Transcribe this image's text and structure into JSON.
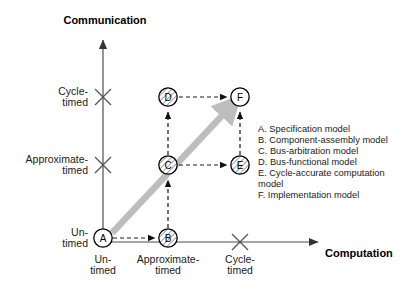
{
  "diagram": {
    "axes": {
      "y_title": "Communication",
      "x_title": "Computation",
      "y_ticks": [
        {
          "line1": "Cycle-",
          "line2": "timed"
        },
        {
          "line1": "Approximate-",
          "line2": "timed"
        },
        {
          "line1": "Un-",
          "line2": "timed"
        }
      ],
      "x_ticks": [
        {
          "line1": "Un-",
          "line2": "timed"
        },
        {
          "line1": "Approximate-",
          "line2": "timed"
        },
        {
          "line1": "Cycle-",
          "line2": "timed"
        }
      ]
    },
    "nodes": [
      {
        "id": "A",
        "label": "A"
      },
      {
        "id": "B",
        "label": "B"
      },
      {
        "id": "C",
        "label": "C"
      },
      {
        "id": "D",
        "label": "D"
      },
      {
        "id": "E",
        "label": "E"
      },
      {
        "id": "F",
        "label": "F"
      }
    ],
    "legend": [
      "A. Specification model",
      "B. Component-assembly model",
      "C. Bus-arbitration model",
      "D. Bus-functional model",
      "E. Cycle-accurate computation",
      "model",
      "F. Implementation model"
    ],
    "colors": {
      "axis": "#4d4d4d",
      "node_stroke": "#000000",
      "dashed_arrow": "#1a1a1a",
      "highlight_arrow": "#bdbdbd",
      "text": "#1a1a1a"
    }
  }
}
